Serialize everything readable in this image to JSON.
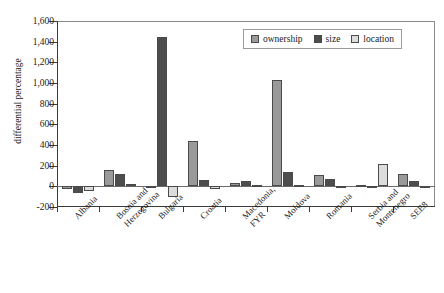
{
  "cropped_caption_text": "",
  "chart_data": {
    "type": "bar",
    "title": "",
    "xlabel": "",
    "ylabel": "differential percentage",
    "ylim": [
      -200,
      1600
    ],
    "ytick_values": [
      1600,
      1400,
      1200,
      1000,
      800,
      600,
      400,
      200,
      0,
      -200
    ],
    "ytick_labels": [
      "1,600",
      "1,400",
      "1,200",
      "1,000",
      "800",
      "600",
      "400",
      "200",
      "0",
      "-200"
    ],
    "grid": false,
    "legend_position": "top-right",
    "categories": [
      "Albania",
      "Bosnia and Herzegovina",
      "Bulgaria",
      "Croatia",
      "Macedonia, FYR",
      "Moldova",
      "Romania",
      "Serbia and Montenegro",
      "SEE8"
    ],
    "category_lines": [
      [
        "Albania"
      ],
      [
        "Bosnia and",
        "Herzegovina"
      ],
      [
        "Bulgaria"
      ],
      [
        "Croatia"
      ],
      [
        "Macedonia,",
        "FYR"
      ],
      [
        "Moldova"
      ],
      [
        "Romania"
      ],
      [
        "Serbia and",
        "Montenegro"
      ],
      [
        "SEE8"
      ]
    ],
    "series": [
      {
        "name": "ownership",
        "color": "#9a9a9a",
        "values": [
          -30,
          155,
          0,
          440,
          35,
          1030,
          105,
          10,
          115
        ]
      },
      {
        "name": "size",
        "color": "#4d4d4d",
        "values": [
          -65,
          120,
          1450,
          65,
          55,
          140,
          75,
          5,
          55
        ]
      },
      {
        "name": "location",
        "color": "#dcdcdc",
        "values": [
          -45,
          20,
          -100,
          -30,
          10,
          15,
          5,
          215,
          -20
        ]
      }
    ]
  },
  "legend": {
    "items": [
      {
        "label": "ownership",
        "key": "ownership"
      },
      {
        "label": "size",
        "key": "size"
      },
      {
        "label": "location",
        "key": "location"
      }
    ]
  }
}
